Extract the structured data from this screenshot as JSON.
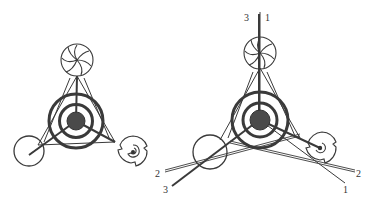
{
  "figure": {
    "colors": {
      "ink": "#3a3a3a",
      "hub": "#4a4a4a",
      "background": "#ffffff"
    },
    "left_diagram": {
      "labels": []
    },
    "right_diagram": {
      "labels": {
        "top_left": "3",
        "top_right": "1",
        "bottom_left_upper": "2",
        "bottom_left_lower": "3",
        "bottom_right_upper": "2",
        "bottom_right_lower": "1"
      }
    }
  }
}
